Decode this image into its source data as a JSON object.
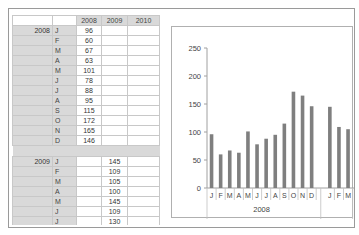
{
  "table": {
    "columns": [
      "2008",
      "2009",
      "2010"
    ],
    "groups": [
      {
        "year": "2008",
        "rows": [
          {
            "month": "J",
            "values": [
              "96",
              "",
              ""
            ]
          },
          {
            "month": "F",
            "values": [
              "60",
              "",
              ""
            ]
          },
          {
            "month": "M",
            "values": [
              "67",
              "",
              ""
            ]
          },
          {
            "month": "A",
            "values": [
              "63",
              "",
              ""
            ]
          },
          {
            "month": "M",
            "values": [
              "101",
              "",
              ""
            ]
          },
          {
            "month": "J",
            "values": [
              "78",
              "",
              ""
            ]
          },
          {
            "month": "J",
            "values": [
              "88",
              "",
              ""
            ]
          },
          {
            "month": "A",
            "values": [
              "95",
              "",
              ""
            ]
          },
          {
            "month": "S",
            "values": [
              "115",
              "",
              ""
            ]
          },
          {
            "month": "O",
            "values": [
              "172",
              "",
              ""
            ]
          },
          {
            "month": "N",
            "values": [
              "165",
              "",
              ""
            ]
          },
          {
            "month": "D",
            "values": [
              "146",
              "",
              ""
            ]
          }
        ]
      },
      {
        "year": "2009",
        "rows": [
          {
            "month": "J",
            "values": [
              "",
              "145",
              ""
            ]
          },
          {
            "month": "F",
            "values": [
              "",
              "109",
              ""
            ]
          },
          {
            "month": "M",
            "values": [
              "",
              "105",
              ""
            ]
          },
          {
            "month": "A",
            "values": [
              "",
              "100",
              ""
            ]
          },
          {
            "month": "M",
            "values": [
              "",
              "145",
              ""
            ]
          },
          {
            "month": "J",
            "values": [
              "",
              "109",
              ""
            ]
          },
          {
            "month": "J",
            "values": [
              "",
              "130",
              ""
            ]
          },
          {
            "month": "A",
            "values": [
              "",
              "140",
              ""
            ]
          }
        ]
      }
    ]
  },
  "chart_data": {
    "type": "bar",
    "title": "",
    "xlabel": "",
    "ylabel": "",
    "ylim": [
      0,
      250
    ],
    "yticks": [
      0,
      50,
      100,
      150,
      200,
      250
    ],
    "grid": false,
    "legend": null,
    "bar_color": "#7f7f7f",
    "groups": [
      {
        "label": "2008",
        "categories": [
          "J",
          "F",
          "M",
          "A",
          "M",
          "J",
          "J",
          "A",
          "S",
          "O",
          "N",
          "D"
        ],
        "values": [
          96,
          60,
          67,
          63,
          101,
          78,
          88,
          95,
          115,
          172,
          165,
          146
        ]
      },
      {
        "label": "",
        "categories": [
          "J",
          "F",
          "M"
        ],
        "values": [
          145,
          109,
          105
        ]
      }
    ]
  }
}
